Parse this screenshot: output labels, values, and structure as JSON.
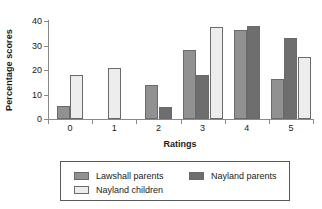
{
  "chart_data": {
    "type": "bar",
    "title": "",
    "xlabel": "Ratings",
    "ylabel": "Percentage scores",
    "categories": [
      "0",
      "1",
      "2",
      "3",
      "4",
      "5"
    ],
    "ylim": [
      0,
      40
    ],
    "yticks": [
      0,
      10,
      20,
      30,
      40
    ],
    "ytick_labels": [
      "0",
      "10",
      "20",
      "30",
      "40"
    ],
    "grid": false,
    "legend_position": "bottom",
    "series": [
      {
        "name": "Lawshall parents",
        "color": "#919191",
        "values": [
          5.5,
          0,
          14,
          28,
          36.5,
          16.5
        ]
      },
      {
        "name": "Nayland parents",
        "color": "#6e6e6e",
        "values": [
          0,
          0,
          5,
          18,
          38,
          33
        ]
      },
      {
        "name": "Nayland children",
        "color": "#ededed",
        "values": [
          18,
          21,
          0,
          37.5,
          0,
          25.5
        ]
      }
    ]
  },
  "legend": {
    "entries": [
      {
        "label": "Lawshall parents",
        "color": "#919191"
      },
      {
        "label": "Nayland parents",
        "color": "#6e6e6e"
      },
      {
        "label": "Nayland children",
        "color": "#ededed"
      }
    ]
  },
  "axes": {
    "y_title": "Percentage scores",
    "x_title": "Ratings"
  }
}
